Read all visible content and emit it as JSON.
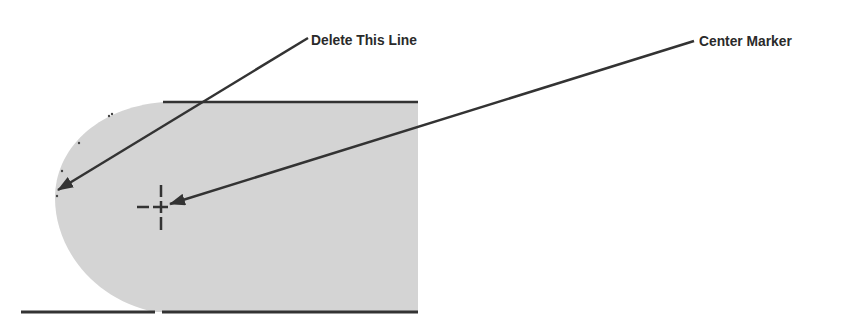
{
  "diagram": {
    "callouts": [
      {
        "id": "delete-line",
        "label": "Delete This Line",
        "x": 311,
        "y": 32
      },
      {
        "id": "center-marker",
        "label": "Center Marker",
        "x": 699,
        "y": 33
      }
    ],
    "shape": {
      "fill": "#d4d4d4",
      "edge_color": "#333333",
      "top_line": {
        "x1": 163,
        "x2": 418,
        "y": 102
      },
      "bottom_line": {
        "x1": 21,
        "x2": 418,
        "y": 312,
        "gap_at_x": 158
      },
      "right_edge_x": 418,
      "arc_left_x": 55
    },
    "center_mark": {
      "x": 161,
      "y": 207
    },
    "colors": {
      "text": "#2a2a2a",
      "line": "#333333",
      "fill": "#d4d4d4"
    }
  }
}
